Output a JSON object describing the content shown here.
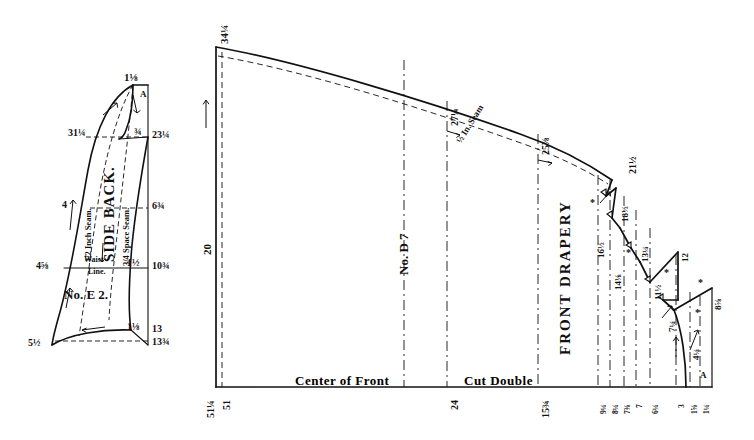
{
  "diagram": {
    "type": "sewing-pattern-draft"
  },
  "side_back": {
    "piece_name": "SIDE BACK.",
    "piece_number": "No. E 2.",
    "corner_letter": "A",
    "waist_line_label_1": "Waist",
    "waist_line_label_2": "Line.",
    "seam_label_left": "1/2 Inch Seam.",
    "seam_label_right": "3/4 Space Seam.",
    "left_measures": [
      "31¼",
      "4",
      "4⅝",
      "5½"
    ],
    "top_measures": [
      "1⅛",
      "¾"
    ],
    "right_measures": [
      "23¼",
      "6¾",
      "10¾",
      "13",
      "13¾"
    ],
    "inner_measures": [
      "1½",
      "1⅛"
    ]
  },
  "drapery": {
    "piece_name": "FRONT DRAPERY",
    "piece_number": "No. D 7",
    "corner_letter": "A",
    "center_front_label": "Center of Front",
    "cut_double_label": "Cut Double",
    "seam_allowance_label": "½ In. Seam",
    "top_left_measure": "34¼",
    "left_vertical_measure": "20",
    "top_edge_measures": [
      "27¼",
      "25⅞",
      "21½"
    ],
    "step_measures": [
      "16½",
      "18½",
      "14⅛",
      "13¼",
      "11½",
      "12",
      "7¼",
      "8⅝",
      "4¼"
    ],
    "bottom_measures_left": [
      "51¼",
      "51",
      "24",
      "15¾"
    ],
    "bottom_measures_right": [
      "9¼",
      "8¼",
      "7⅜",
      "7",
      "6¼",
      "3",
      "1⅝",
      "1¼"
    ],
    "asterisks": [
      "*",
      "*",
      "*",
      "*",
      "*"
    ]
  },
  "colors": {
    "ink": "#111111",
    "paper": "#ffffff"
  }
}
